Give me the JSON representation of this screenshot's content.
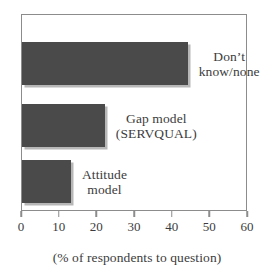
{
  "chart_data": {
    "type": "bar",
    "orientation": "horizontal",
    "title": "",
    "xlabel": "(% of respondents to question)",
    "ylabel": "",
    "xlim": [
      0,
      60
    ],
    "xticks": [
      0,
      10,
      20,
      30,
      40,
      50,
      60
    ],
    "xtick_labels": [
      "0",
      "10",
      "20",
      "30",
      "40",
      "50",
      "60"
    ],
    "grid": false,
    "legend": null,
    "bar_color": "#4a4a4a",
    "frame_color": "#8c8c8c",
    "categories": [
      "Don't know/none",
      "Gap model (SERVQUAL)",
      "Attitude model"
    ],
    "values": [
      44,
      22,
      13
    ],
    "bars": [
      {
        "label_line1": "Don’t",
        "label_line2": "know/none",
        "value": 44
      },
      {
        "label_line1": "Gap model",
        "label_line2": "(SERVQUAL)",
        "value": 22
      },
      {
        "label_line1": "Attitude",
        "label_line2": "model",
        "value": 13
      }
    ]
  },
  "caption": "(% of respondents to question)"
}
